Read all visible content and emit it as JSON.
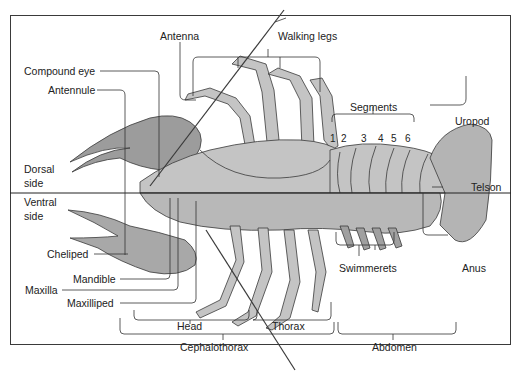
{
  "diagram": {
    "divider": {
      "upper_label": [
        "Dorsal",
        "side"
      ],
      "lower_label": [
        "Ventral",
        "side"
      ]
    },
    "labels": {
      "antenna": "Antenna",
      "walking_legs": "Walking legs",
      "compound_eye": "Compound eye",
      "antennule": "Antennule",
      "segments": "Segments",
      "uropod": "Uropod",
      "telson": "Telson",
      "dorsal_1": "Dorsal",
      "dorsal_2": "side",
      "ventral_1": "Ventral",
      "ventral_2": "side",
      "cheliped": "Cheliped",
      "mandible": "Mandible",
      "maxilla": "Maxilla",
      "maxilliped": "Maxilliped",
      "swimmerets": "Swimmerets",
      "anus": "Anus",
      "head": "Head",
      "thorax": "Thorax",
      "cephalothorax": "Cephalothorax",
      "abdomen": "Abdomen"
    },
    "segment_numbers": [
      "1",
      "2",
      "3",
      "4",
      "5",
      "6"
    ],
    "colors": {
      "body_fill": "#c4c4c4",
      "outline": "#3a3a3a",
      "leader_line": "#333333",
      "background": "#ffffff"
    }
  }
}
